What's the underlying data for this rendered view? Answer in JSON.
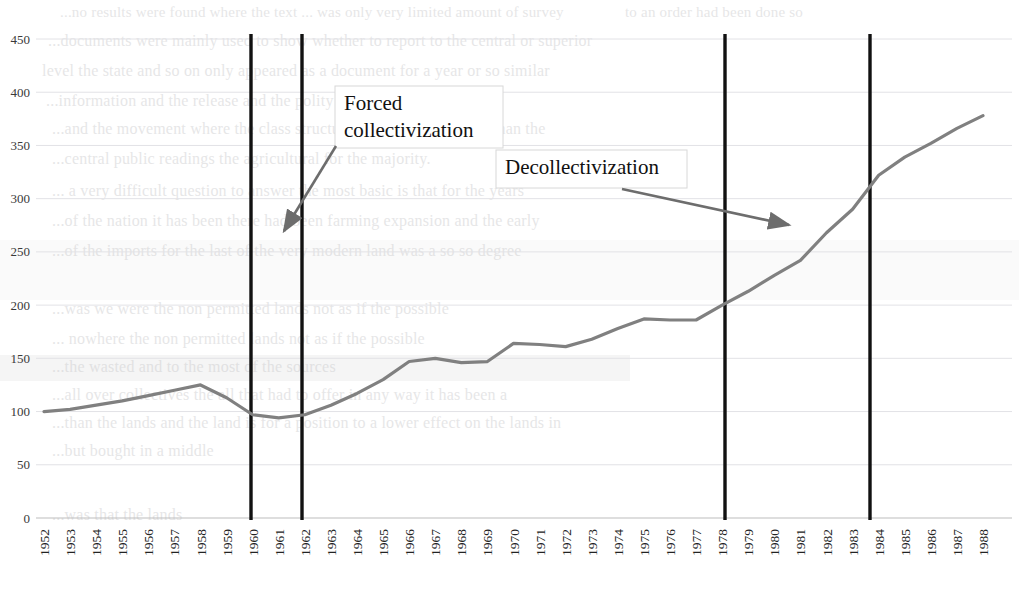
{
  "chart_data": {
    "type": "line",
    "title": "",
    "xlabel": "",
    "ylabel": "",
    "ylim": [
      0,
      450
    ],
    "yticks": [
      0,
      50,
      100,
      150,
      200,
      250,
      300,
      350,
      400,
      450
    ],
    "grid": true,
    "legend": "none",
    "line_color": "#808080",
    "x": [
      1952,
      1953,
      1954,
      1955,
      1956,
      1957,
      1958,
      1959,
      1960,
      1961,
      1962,
      1963,
      1964,
      1965,
      1966,
      1967,
      1968,
      1969,
      1970,
      1971,
      1972,
      1973,
      1974,
      1975,
      1976,
      1977,
      1978,
      1979,
      1980,
      1981,
      1982,
      1983,
      1984,
      1985,
      1986,
      1987,
      1988
    ],
    "categories": [
      "1952",
      "1953",
      "1954",
      "1955",
      "1956",
      "1957",
      "1958",
      "1959",
      "1960",
      "1961",
      "1962",
      "1963",
      "1964",
      "1965",
      "1966",
      "1967",
      "1968",
      "1969",
      "1970",
      "1971",
      "1972",
      "1973",
      "1974",
      "1975",
      "1976",
      "1977",
      "1978",
      "1979",
      "1980",
      "1981",
      "1982",
      "1983",
      "1984",
      "1985",
      "1986",
      "1987",
      "1988"
    ],
    "values": [
      100,
      102,
      106,
      110,
      115,
      120,
      125,
      113,
      97,
      94,
      97,
      106,
      117,
      130,
      147,
      150,
      146,
      147,
      164,
      163,
      161,
      168,
      178,
      187,
      186,
      186,
      200,
      213,
      228,
      242,
      268,
      290,
      322,
      339,
      352,
      366,
      378
    ],
    "series": [
      {
        "name": "grain output index",
        "values": [
          100,
          102,
          106,
          110,
          115,
          120,
          125,
          113,
          97,
          94,
          97,
          106,
          117,
          130,
          147,
          150,
          146,
          147,
          164,
          163,
          161,
          168,
          178,
          187,
          186,
          186,
          200,
          213,
          228,
          242,
          268,
          290,
          322,
          339,
          352,
          366,
          378
        ]
      }
    ],
    "annotations": [
      {
        "id": "forced-collectivization",
        "label": "Forced\ncollectivization",
        "label_line1": "Forced",
        "label_line2": "collectivization",
        "box": {
          "x": 335,
          "y": 86,
          "w": 168,
          "h": 62
        },
        "arrow": {
          "x1": 336,
          "y1": 146,
          "x2": 284,
          "y2": 231
        }
      },
      {
        "id": "decollectivization",
        "label": "Decollectivization",
        "label_line1": "Decollectivization",
        "box": {
          "x": 496,
          "y": 150,
          "w": 191,
          "h": 38
        },
        "arrow": {
          "x1": 622,
          "y1": 189,
          "x2": 789,
          "y2": 225
        }
      }
    ],
    "vlines": [
      {
        "year": 1959,
        "x": 251
      },
      {
        "year": 1961,
        "x": 302
      },
      {
        "year": 1978,
        "x": 725
      },
      {
        "year": 1984,
        "x": 870
      }
    ]
  },
  "ghost_text": {
    "rows": [
      {
        "x": 60,
        "y": 4,
        "size": 15,
        "text": "...no results were found where the text ... was only very limited amount of survey"
      },
      {
        "x": 625,
        "y": 4,
        "size": 15,
        "text": "to an order had been done so"
      },
      {
        "x": 48,
        "y": 32,
        "size": 16,
        "text": "...documents were mainly used to show whether to report to the central or superior"
      },
      {
        "x": 42,
        "y": 62,
        "size": 16,
        "text": "level the state and so on only appeared as a document for a year or so similar"
      },
      {
        "x": 46,
        "y": 92,
        "size": 16,
        "text": "...information and the release and the polity being and no permitted"
      },
      {
        "x": 52,
        "y": 120,
        "size": 16,
        "text": "...and the movement where the class structure of labor was similar than the"
      },
      {
        "x": 52,
        "y": 150,
        "size": 16,
        "text": "...central public readings the agricultural for the majority."
      },
      {
        "x": 52,
        "y": 182,
        "size": 16,
        "text": "... a very difficult question to answer the most basic is that for the years"
      },
      {
        "x": 52,
        "y": 212,
        "size": 16,
        "text": "...of the nation it has been there had been farming expansion and the early"
      },
      {
        "x": 52,
        "y": 242,
        "size": 16,
        "text": "...of the imports for the last of the very modern land was a so so degree"
      },
      {
        "x": 52,
        "y": 300,
        "size": 16,
        "text": "...was we were the non permitted lands not as if the possible"
      },
      {
        "x": 52,
        "y": 330,
        "size": 16,
        "text": "... nowhere the non permitted lands not as if the possible"
      },
      {
        "x": 52,
        "y": 358,
        "size": 16,
        "text": "...the wasted and to the most of the sources"
      },
      {
        "x": 52,
        "y": 386,
        "size": 16,
        "text": "...all over collectives the all that had to offer in any way it has been a"
      },
      {
        "x": 52,
        "y": 414,
        "size": 16,
        "text": "...than the lands and the land is for a position to a lower effect on the lands in"
      },
      {
        "x": 52,
        "y": 442,
        "size": 16,
        "text": "...but bought in a middle"
      },
      {
        "x": 52,
        "y": 506,
        "size": 16,
        "text": "...was that the lands"
      }
    ]
  }
}
